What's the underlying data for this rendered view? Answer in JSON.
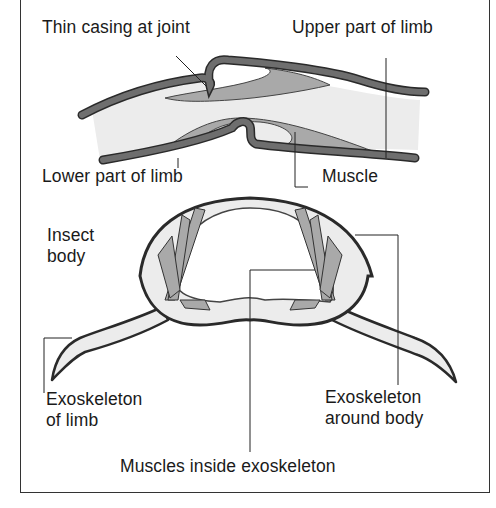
{
  "diagram": {
    "top_section": {
      "labels": {
        "thin_casing": "Thin casing at joint",
        "upper_limb": "Upper part of limb",
        "lower_limb": "Lower part of limb",
        "muscle": "Muscle"
      }
    },
    "bottom_section": {
      "labels": {
        "insect_body_line1": "Insect",
        "insect_body_line2": "body",
        "exo_limb_line1": "Exoskeleton",
        "exo_limb_line2": "of limb",
        "exo_body_line1": "Exoskeleton",
        "exo_body_line2": "around body",
        "muscles_inside": "Muscles inside exoskeleton"
      }
    },
    "colors": {
      "exoskeleton": "#6e6e6e",
      "muscle": "#a9a9a9",
      "interior": "#ececec",
      "outline": "#2a2a2a",
      "frame": "#333333"
    }
  }
}
